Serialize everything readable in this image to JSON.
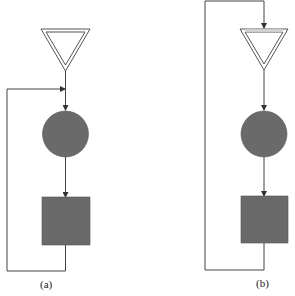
{
  "diagrams": [
    {
      "label": "(a)",
      "description": "Feedback loop re-entering between triangle and circle",
      "nodes": [
        "triangle",
        "circle",
        "square"
      ],
      "feedback": "square output loops back to input of circle"
    },
    {
      "label": "(b)",
      "description": "Feedback loop re-entering before triangle",
      "nodes": [
        "triangle",
        "circle",
        "square"
      ],
      "feedback": "square output loops back to input of triangle"
    }
  ],
  "colors": {
    "shape_fill": "#6a6a6a",
    "line": "#444444",
    "background": "#ffffff"
  }
}
